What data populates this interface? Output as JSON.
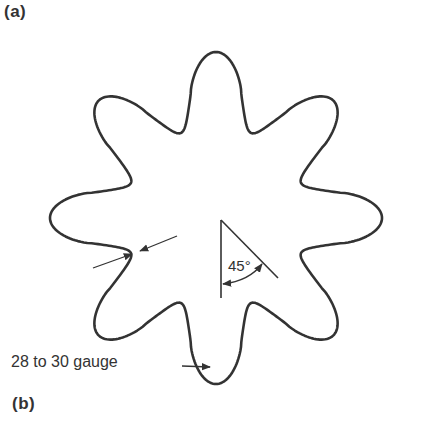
{
  "figure": {
    "panel_a_label": "(a)",
    "panel_b_label": "(b)",
    "shape": {
      "name": "eight-pointed star cross-section",
      "points": 8
    },
    "annotations": {
      "angle_label": "45°",
      "gauge_label": "28 to 30 gauge"
    },
    "colors": {
      "stroke": "#333333",
      "background": "#ffffff"
    }
  }
}
